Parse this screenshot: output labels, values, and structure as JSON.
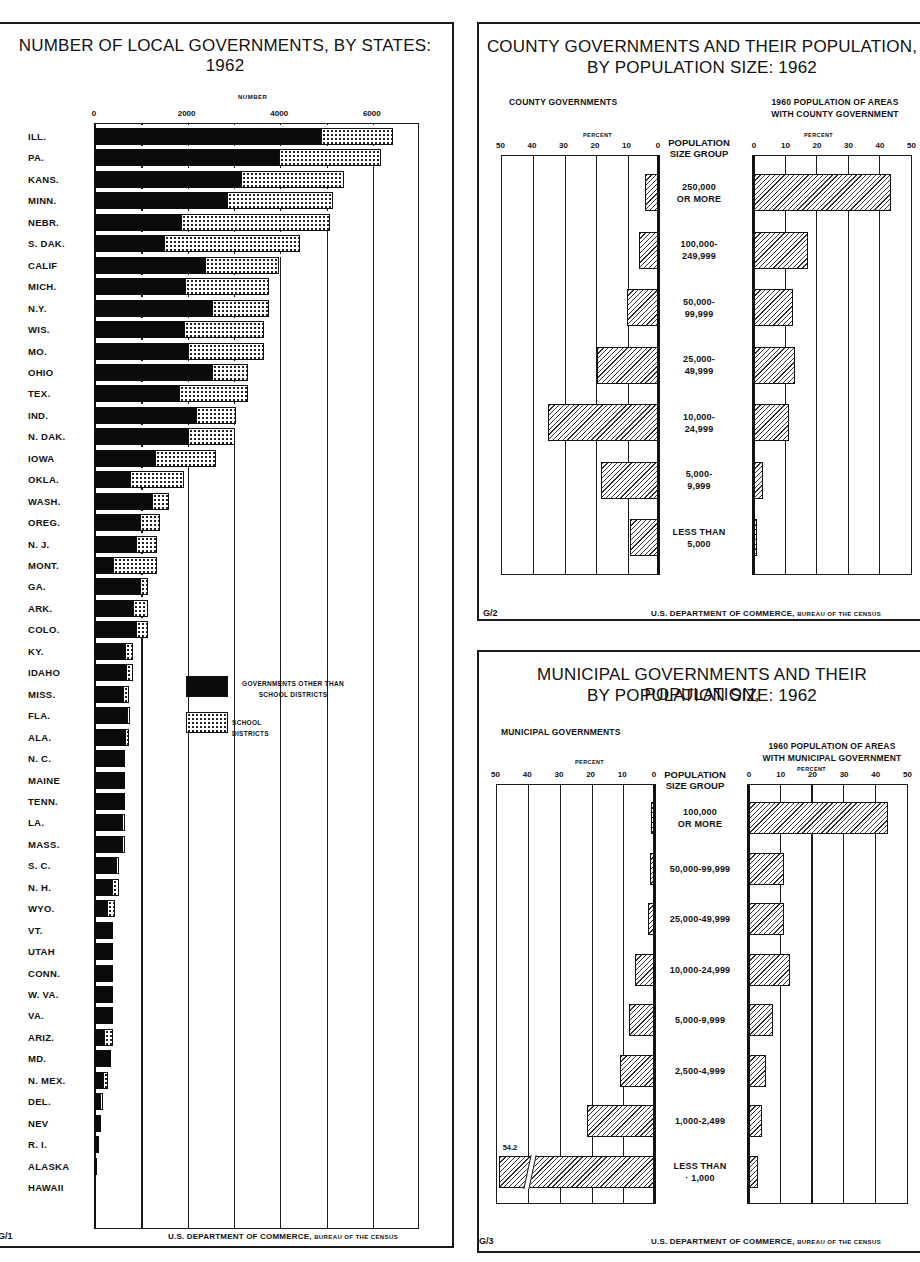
{
  "chart_data": [
    {
      "id": "G/1",
      "type": "bar",
      "orientation": "horizontal",
      "stacked": true,
      "title": "NUMBER OF LOCAL GOVERNMENTS, BY STATES: 1962",
      "xlabel": "NUMBER",
      "ylabel": "",
      "xlim": [
        0,
        7000
      ],
      "xticks": [
        "0",
        "2000",
        "4000",
        "6000"
      ],
      "grid": "vertical every 1000",
      "legend_position": "inside, center-left",
      "categories": [
        "ILL.",
        "PA.",
        "KANS.",
        "MINN.",
        "NEBR.",
        "S. DAK.",
        "CALIF",
        "MICH.",
        "N.Y.",
        "WIS.",
        "MO.",
        "OHIO",
        "TEX.",
        "IND.",
        "N. DAK.",
        "IOWA",
        "OKLA.",
        "WASH.",
        "OREG.",
        "N. J.",
        "MONT.",
        "GA.",
        "ARK.",
        "COLO.",
        "KY.",
        "IDAHO",
        "MISS.",
        "FLA.",
        "ALA.",
        "N. C.",
        "MAINE",
        "TENN.",
        "LA.",
        "MASS.",
        "S. C.",
        "N. H.",
        "WYO.",
        "VT.",
        "UTAH",
        "CONN.",
        "W. VA.",
        "VA.",
        "ARIZ.",
        "MD.",
        "N. MEX.",
        "DEL.",
        "NEV",
        "R. I.",
        "ALASKA",
        "HAWAII"
      ],
      "series": [
        {
          "name": "GOVERNMENTS OTHER THAN SCHOOL DISTRICTS",
          "pattern": "solid-black",
          "values": [
            4900,
            4000,
            3170,
            2870,
            1880,
            1510,
            2400,
            1970,
            2550,
            1950,
            2030,
            2550,
            1840,
            2200,
            2030,
            1310,
            780,
            1250,
            990,
            900,
            400,
            1000,
            840,
            900,
            680,
            700,
            630,
            720,
            680,
            660,
            680,
            680,
            600,
            600,
            480,
            380,
            280,
            420,
            420,
            420,
            420,
            420,
            220,
            360,
            200,
            120,
            160,
            100,
            60,
            20
          ]
        },
        {
          "name": "SCHOOL DISTRICTS",
          "pattern": "dotted",
          "values": [
            1550,
            2200,
            2230,
            2300,
            3220,
            2940,
            1600,
            1810,
            1230,
            1720,
            1640,
            780,
            1490,
            870,
            1020,
            1320,
            1160,
            380,
            440,
            460,
            960,
            170,
            330,
            270,
            160,
            140,
            120,
            30,
            70,
            0,
            0,
            0,
            60,
            40,
            70,
            170,
            170,
            0,
            0,
            0,
            0,
            0,
            200,
            0,
            100,
            80,
            0,
            0,
            0,
            0
          ]
        }
      ]
    },
    {
      "id": "G/2",
      "type": "bar",
      "orientation": "horizontal",
      "layout": "butterfly",
      "title": "COUNTY GOVERNMENTS AND THEIR POPULATION, BY POPULATION SIZE: 1962",
      "categories": [
        "250,000 OR MORE",
        "100,000-249,999",
        "50,000-99,999",
        "25,000-49,999",
        "10,000-24,999",
        "5,000-9,999",
        "LESS THAN 5,000"
      ],
      "center_label": "POPULATION SIZE GROUP",
      "xlabel": "PERCENT",
      "xlim": [
        0,
        50
      ],
      "xticks": [
        "0",
        "10",
        "20",
        "30",
        "40",
        "50"
      ],
      "series": [
        {
          "name": "COUNTY GOVERNMENTS",
          "side": "left",
          "values": [
            4,
            6,
            10,
            19.5,
            35,
            18,
            9
          ]
        },
        {
          "name": "1960 POPULATION OF AREAS WITH COUNTY GOVERNMENT",
          "side": "right",
          "values": [
            43.5,
            17,
            12.5,
            13,
            11,
            3,
            1
          ]
        }
      ]
    },
    {
      "id": "G/3",
      "type": "bar",
      "orientation": "horizontal",
      "layout": "butterfly",
      "title": "MUNICIPAL GOVERNMENTS AND THEIR POPULATION, BY POPULATION SIZE: 1962",
      "categories": [
        "100,000 OR MORE",
        "50,000-99,999",
        "25,000-49,999",
        "10,000-24,999",
        "5,000-9,999",
        "2,500-4,999",
        "1,000-2,499",
        "LESS THAN 1,000"
      ],
      "center_label": "POPULATION SIZE GROUP",
      "xlabel": "PERCENT",
      "xlim": [
        0,
        50
      ],
      "xticks": [
        "0",
        "10",
        "20",
        "30",
        "40",
        "50"
      ],
      "annotations": [
        {
          "text": "54.2",
          "target": "LESS THAN 1,000 (left, broken bar)"
        }
      ],
      "series": [
        {
          "name": "MUNICIPAL GOVERNMENTS",
          "side": "left",
          "values": [
            1,
            1.2,
            2,
            6,
            7.8,
            10.6,
            21,
            54.2
          ]
        },
        {
          "name": "1960 POPULATION OF AREAS WITH MUNICIPAL GOVERNMENT",
          "side": "right",
          "values": [
            43.8,
            11,
            11,
            13,
            7.5,
            5.3,
            4.2,
            2.8
          ]
        }
      ]
    }
  ],
  "panel1": {
    "title_line1": "NUMBER OF LOCAL GOVERNMENTS, BY STATES:",
    "title_line2": "1962",
    "axis_label": "NUMBER",
    "legend_black": "GOVERNMENTS OTHER THAN SCHOOL DISTRICTS",
    "legend_black_l1": "GOVERNMENTS OTHER THAN",
    "legend_black_l2": "SCHOOL DISTRICTS",
    "legend_dot": "SCHOOL DISTRICTS",
    "code": "G/1",
    "source_main": "U.S. DEPARTMENT OF COMMERCE,",
    "source_small": "BUREAU OF THE CENSUS"
  },
  "panel2": {
    "title_line1": "COUNTY GOVERNMENTS AND THEIR POPULATION,",
    "title_line2": "BY POPULATION SIZE: 1962",
    "left_head": "COUNTY GOVERNMENTS",
    "right_head_l1": "1960 POPULATION OF AREAS",
    "right_head_l2": "WITH COUNTY GOVERNMENT",
    "pct": "PERCENT",
    "center_l1": "POPULATION",
    "center_l2": "SIZE GROUP",
    "labels": [
      [
        "250,000",
        "OR MORE"
      ],
      [
        "100,000-",
        "249,999"
      ],
      [
        "50,000-",
        "99,999"
      ],
      [
        "25,000-",
        "49,999"
      ],
      [
        "10,000-",
        "24,999"
      ],
      [
        "5,000-",
        "9,999"
      ],
      [
        "LESS THAN",
        "5,000"
      ]
    ],
    "code": "G/2",
    "source_main": "U.S. DEPARTMENT OF COMMERCE,",
    "source_small": "BUREAU OF THE CENSUS"
  },
  "panel3": {
    "title_line1": "MUNICIPAL GOVERNMENTS AND THEIR POPULATION,",
    "title_line2": "BY POPULATION SIZE: 1962",
    "left_head": "MUNICIPAL GOVERNMENTS",
    "right_head_l1": "1960 POPULATION OF AREAS",
    "right_head_l2": "WITH MUNICIPAL GOVERNMENT",
    "pct": "PERCENT",
    "center_l1": "POPULATION",
    "center_l2": "SIZE GROUP",
    "labels": [
      [
        "100,000",
        "OR MORE"
      ],
      [
        "50,000-99,999"
      ],
      [
        "25,000-49,999"
      ],
      [
        "10,000-24,999"
      ],
      [
        "5,000-9,999"
      ],
      [
        "2,500-4,999"
      ],
      [
        "1,000-2,499"
      ],
      [
        "LESS THAN",
        "· 1,000"
      ]
    ],
    "annotation": "54.2",
    "code": "G/3",
    "source_main": "U.S. DEPARTMENT OF COMMERCE,",
    "source_small": "BUREAU OF THE CENSUS"
  },
  "ticks": [
    "50",
    "40",
    "30",
    "20",
    "10",
    "0"
  ],
  "ticks_r": [
    "0",
    "10",
    "20",
    "30",
    "40",
    "50"
  ]
}
